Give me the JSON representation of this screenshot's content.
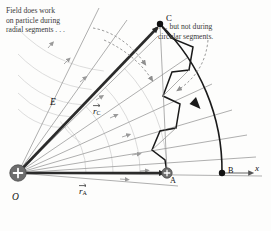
{
  "figure": {
    "background": "#fdfdfc"
  },
  "annotations": {
    "left_note": "Field does work\non particle during\nradial segments . . .",
    "right_note": ". . . but not during\ncircular segments."
  },
  "labels": {
    "origin": "O",
    "point_c": "C",
    "point_a": "A",
    "point_b": "B",
    "axis_x": "x",
    "field": "E",
    "vector_rc_symbol": "r",
    "vector_rc_sub": "C",
    "vector_ra_symbol": "r",
    "vector_ra_sub": "A"
  },
  "colors": {
    "field_line": "#9a9a9a",
    "arc_grid": "#cfcfcf",
    "path": "#1a1a1a",
    "vector": "#2b2b2b",
    "charge_fill": "#6d6d6d",
    "dashed_pointer": "#8e8e8e",
    "text": "#3a3a3a"
  },
  "geometry": {
    "origin": [
      18,
      173
    ],
    "point_a": [
      167,
      173
    ],
    "point_b": [
      222,
      173
    ],
    "point_c": [
      160,
      24
    ],
    "radius_a": 149,
    "radius_c": 204,
    "field_line_count": 8,
    "arc_count": 5,
    "staircase_steps": 5
  }
}
